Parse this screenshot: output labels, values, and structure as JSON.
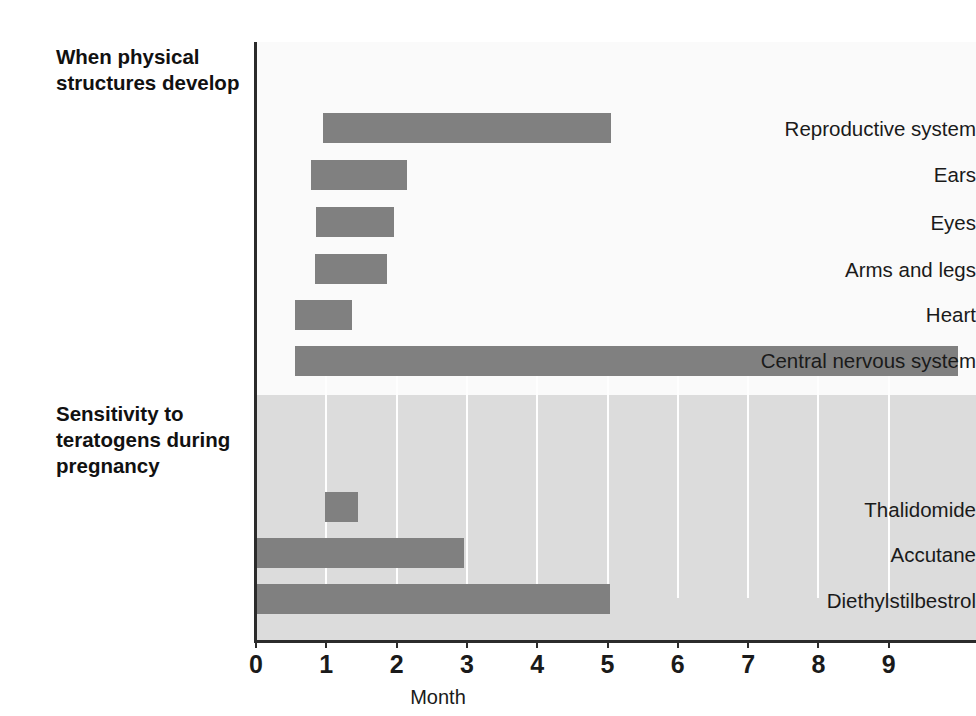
{
  "chart_data": {
    "type": "bar",
    "orientation": "horizontal-range",
    "title": "",
    "xlabel": "Month",
    "ylabel": "",
    "xlim": [
      0,
      10.25
    ],
    "xticks": [
      0,
      1,
      2,
      3,
      4,
      5,
      6,
      7,
      8,
      9
    ],
    "xtick_labels": [
      "0",
      "1",
      "2",
      "3",
      "4",
      "5",
      "6",
      "7",
      "8",
      "9"
    ],
    "grid": "vertical gridlines visible on shaded lower panel only",
    "legend": "none",
    "bar_color": "#808080",
    "panels": [
      {
        "id": "physical-structures",
        "title": "When physical structures develop",
        "background": "#fafafa",
        "bars": [
          {
            "label": "Reproductive system",
            "start": 0.95,
            "end": 5.05
          },
          {
            "label": "Ears",
            "start": 0.78,
            "end": 2.15
          },
          {
            "label": "Eyes",
            "start": 0.86,
            "end": 1.97
          },
          {
            "label": "Arms and legs",
            "start": 0.84,
            "end": 1.87
          },
          {
            "label": "Heart",
            "start": 0.55,
            "end": 1.37
          },
          {
            "label": "Central nervous system",
            "start": 0.56,
            "end": 9.98
          }
        ]
      },
      {
        "id": "teratogen-sensitivity",
        "title": "Sensitivity to teratogens during pregnancy",
        "background": "#dcdcdc",
        "bars": [
          {
            "label": "Thalidomide",
            "start": 0.98,
            "end": 1.45
          },
          {
            "label": "Accutane",
            "start": 0.0,
            "end": 2.96
          },
          {
            "label": "Diethylstilbestrol",
            "start": 0.0,
            "end": 5.03
          }
        ]
      }
    ]
  },
  "labels": {
    "section_physical": "When physical structures develop",
    "section_sensitivity": "Sensitivity to teratogens during pregnancy",
    "row_reproductive": "Reproductive system",
    "row_ears": "Ears",
    "row_eyes": "Eyes",
    "row_arms_legs": "Arms and legs",
    "row_heart": "Heart",
    "row_cns": "Central nervous system",
    "row_thalidomide": "Thalidomide",
    "row_accutane": "Accutane",
    "row_des": "Diethylstilbestrol",
    "axis_month": "Month",
    "tick_0": "0",
    "tick_1": "1",
    "tick_2": "2",
    "tick_3": "3",
    "tick_4": "4",
    "tick_5": "5",
    "tick_6": "6",
    "tick_7": "7",
    "tick_8": "8",
    "tick_9": "9"
  }
}
